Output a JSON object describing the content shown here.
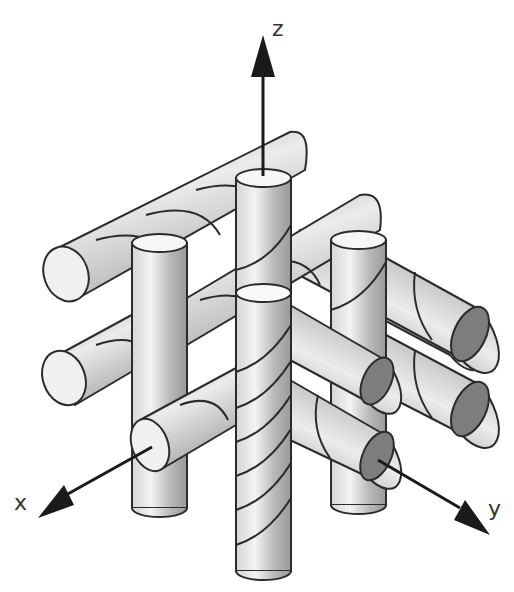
{
  "diagram": {
    "type": "3d-rod-lattice",
    "axes": {
      "x": {
        "label": "x"
      },
      "y": {
        "label": "y"
      },
      "z": {
        "label": "z"
      }
    },
    "colors": {
      "outline": "#2b2b2b",
      "rod_fill_light": "#f2f2f2",
      "rod_fill_mid": "#bdbdbd",
      "rod_fill_dark": "#8a8a8a",
      "end_cap_light": "#f4f4f4",
      "end_cap_dark": "#7d7d7d",
      "axis_arrow": "#1a1a1a",
      "background": "#ffffff"
    },
    "rod_counts": {
      "z_rods": 5,
      "x_rods": 4,
      "y_rods": 4
    }
  }
}
